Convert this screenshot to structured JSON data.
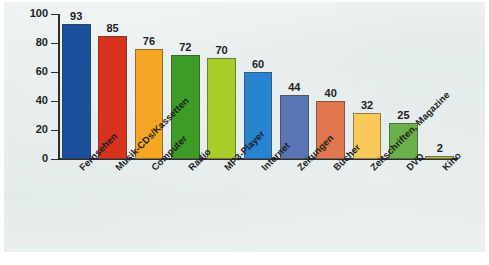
{
  "panel": {
    "background_color": "#e3eaea",
    "top_cut_text": ""
  },
  "chart_data": {
    "type": "bar",
    "title": "",
    "subtitle": "",
    "xlabel": "",
    "ylabel": "",
    "categories": [
      "Fernsehen",
      "Musik-CDs/Kassetten",
      "Computer",
      "Radio",
      "MP3-Player",
      "Internet",
      "Zeitungen",
      "Bücher",
      "Zeitschriften, Magazine",
      "DVD",
      "Kino"
    ],
    "values": [
      93,
      85,
      76,
      72,
      70,
      60,
      44,
      40,
      32,
      25,
      2
    ],
    "value_labels": [
      "93",
      "85",
      "76",
      "72",
      "70",
      "60",
      "44",
      "40",
      "32",
      "25",
      "2"
    ],
    "bar_colors": [
      "#1a4f9c",
      "#d8321c",
      "#f5a623",
      "#3d9b26",
      "#a8cc28",
      "#2684d0",
      "#5a74b4",
      "#e0774e",
      "#fbc85a",
      "#6cb04a",
      "#b8b840"
    ],
    "ylim": [
      0,
      100
    ],
    "yticks": [
      0,
      20,
      40,
      60,
      80,
      100
    ],
    "ytick_labels": [
      "0",
      "20",
      "40",
      "60",
      "80",
      "100"
    ],
    "grid": false,
    "legend": false,
    "legend_position": "none",
    "axis_color": "#2d2d2d",
    "label_rotation_deg": -45
  }
}
